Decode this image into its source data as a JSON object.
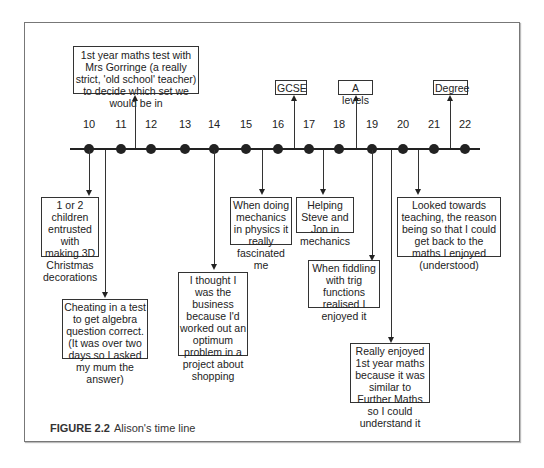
{
  "figure": {
    "caption_label": "FIGURE 2.2",
    "caption_text": "Alison's time line"
  },
  "years": [
    "10",
    "11",
    "12",
    "13",
    "14",
    "15",
    "16",
    "17",
    "18",
    "19",
    "20",
    "21",
    "22"
  ],
  "above_events": {
    "maths_test": "1st year maths test with Mrs Gorringe (a really strict, 'old school' teacher) to decide which set we would be in",
    "gcse": "GCSE",
    "a_levels": "A levels",
    "degree": "Degree"
  },
  "below_events": {
    "christmas": "1 or 2 children entrusted with making 3D Christmas decorations",
    "cheating": "Cheating in a test to get algebra question correct. (It was over two days so I asked my mum the answer)",
    "business": "I thought I was the business because I'd worked out an optimum problem in a project about shopping",
    "mechanics_physics": "When doing mechanics in physics it really fascinated me",
    "helping": "Helping Steve and Jon in mechanics",
    "trig": "When fiddling with trig functions realised I enjoyed it",
    "further_maths": "Really enjoyed 1st year maths because it was similar to Further Maths so I could understand it",
    "teaching": "Looked towards teaching, the reason being so that I could get back to the maths I enjoyed (understood)"
  }
}
